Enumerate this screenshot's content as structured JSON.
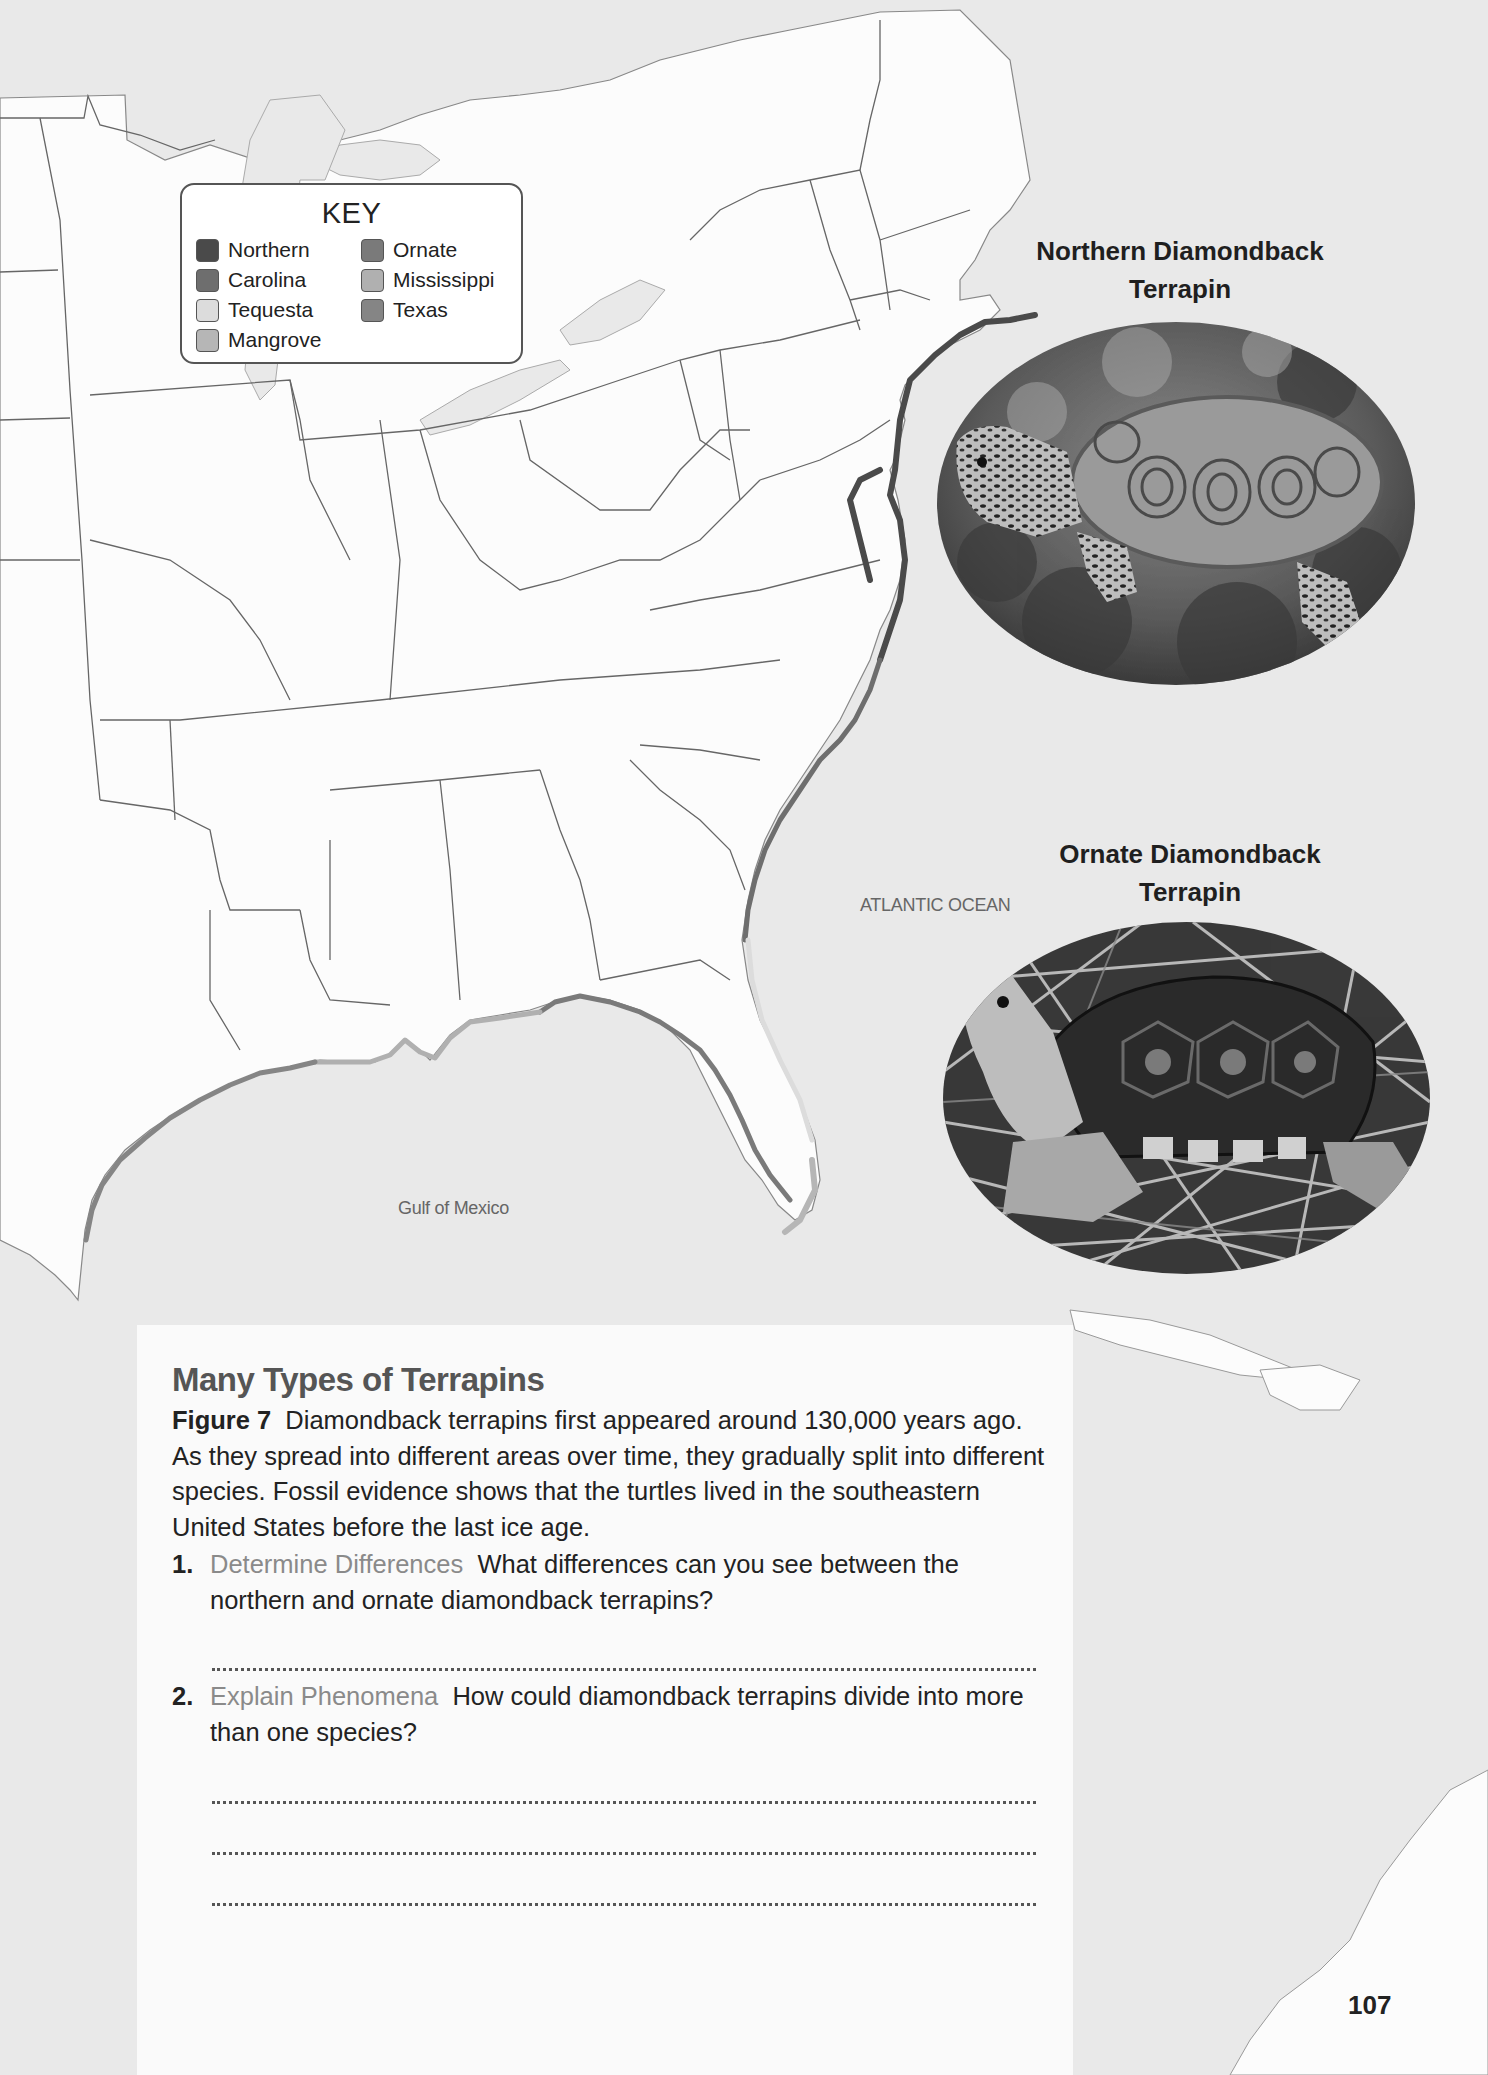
{
  "map": {
    "legend": {
      "title": "KEY",
      "items": [
        {
          "label": "Northern",
          "color": "#4a4a4a"
        },
        {
          "label": "Carolina",
          "color": "#6e6e6e"
        },
        {
          "label": "Tequesta",
          "color": "#dcdcdc"
        },
        {
          "label": "Mangrove",
          "color": "#b6b6b6"
        },
        {
          "label": "Ornate",
          "color": "#7a7a7a"
        },
        {
          "label": "Mississippi",
          "color": "#b0b0b0"
        },
        {
          "label": "Texas",
          "color": "#858585"
        }
      ]
    },
    "labels": {
      "atlantic": "ATLANTIC OCEAN",
      "gulf": "Gulf of Mexico"
    },
    "colors": {
      "ocean": "#e9e9e9",
      "land": "#fcfcfc",
      "border": "#555555"
    }
  },
  "photos": {
    "northern": {
      "title_line1": "Northern Diamondback",
      "title_line2": "Terrapin"
    },
    "ornate": {
      "title_line1": "Ornate Diamondback",
      "title_line2": "Terrapin"
    }
  },
  "panel": {
    "title": "Many Types of Terrapins",
    "figure_label": "Figure 7",
    "caption": "Diamondback terrapins first appeared around 130,000 years ago. As they spread into different areas over time, they gradually split into different species. Fossil evidence shows that the turtles lived in the southeastern United States before the last ice age.",
    "questions": [
      {
        "number": "1.",
        "skill": "Determine Differences",
        "text": "What differences can you see between the northern and ornate diamondback terrapins?",
        "answer_lines": 1
      },
      {
        "number": "2.",
        "skill": "Explain Phenomena",
        "text": "How could diamondback terrapins divide into more than one species?",
        "answer_lines": 3
      }
    ]
  },
  "page_number": "107"
}
